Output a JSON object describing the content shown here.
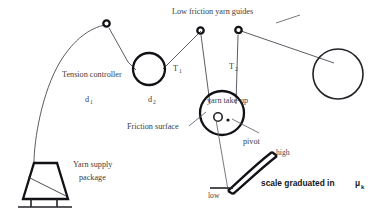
{
  "diagram": {
    "background_color": "#ffffff",
    "line_color": "#222228",
    "text_color": "#3c3c44",
    "labels": {
      "guides": "Low friction yarn guides",
      "tension_controller": "Tension controller",
      "tension_1": "T",
      "tension_1_sub": "1",
      "tension_2": "T",
      "tension_2_sub": "2",
      "distance_1": "d",
      "distance_1_sub": "1",
      "distance_2": "d",
      "distance_2_sub": "2",
      "take_up": "yarn take-up",
      "friction_surface": "Friction surface",
      "pivot": "pivot",
      "high": "high",
      "low": "low",
      "scale": "scale  graduated  in",
      "scale_symbol": "μ",
      "scale_symbol_sub": "k",
      "supply_line1": "Yarn supply",
      "supply_line2": "package"
    },
    "components": [
      {
        "name": "yarn-supply-package",
        "type": "cone-package"
      },
      {
        "name": "guide-1",
        "type": "small-circle"
      },
      {
        "name": "tension-controller-roller",
        "type": "circle"
      },
      {
        "name": "guide-2",
        "type": "small-circle"
      },
      {
        "name": "guide-3",
        "type": "small-circle"
      },
      {
        "name": "take-up-roll",
        "type": "large-circle"
      },
      {
        "name": "yarn-take-up-wheel",
        "type": "circle-with-pivot"
      },
      {
        "name": "measurement-scale-arc",
        "type": "curved-scale"
      },
      {
        "name": "pointer-needle",
        "type": "line"
      }
    ]
  }
}
